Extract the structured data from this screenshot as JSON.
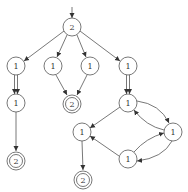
{
  "diagram": {
    "type": "state-graph",
    "start_node": "n0",
    "nodes": [
      {
        "id": "n0",
        "label": "2",
        "x": 72,
        "y": 27,
        "accepting": false
      },
      {
        "id": "n1",
        "label": "1",
        "x": 16,
        "y": 66,
        "accepting": false
      },
      {
        "id": "n2",
        "label": "1",
        "x": 53,
        "y": 66,
        "accepting": false
      },
      {
        "id": "n3",
        "label": "1",
        "x": 90,
        "y": 66,
        "accepting": false
      },
      {
        "id": "n4",
        "label": "1",
        "x": 128,
        "y": 66,
        "accepting": false
      },
      {
        "id": "n5",
        "label": "1",
        "x": 16,
        "y": 103,
        "accepting": false
      },
      {
        "id": "n6",
        "label": "2",
        "x": 72,
        "y": 104,
        "accepting": true
      },
      {
        "id": "n7",
        "label": "1",
        "x": 128,
        "y": 103,
        "accepting": false
      },
      {
        "id": "n8",
        "label": "2",
        "x": 16,
        "y": 161,
        "accepting": true
      },
      {
        "id": "n9",
        "label": "1",
        "x": 82,
        "y": 132,
        "accepting": false
      },
      {
        "id": "n10",
        "label": "1",
        "x": 173,
        "y": 132,
        "accepting": false
      },
      {
        "id": "n11",
        "label": "1",
        "x": 128,
        "y": 159,
        "accepting": false
      },
      {
        "id": "n12",
        "label": "2",
        "x": 83,
        "y": 180,
        "accepting": true
      }
    ],
    "edges": [
      {
        "from": "n0",
        "to": "n1",
        "style": "single"
      },
      {
        "from": "n0",
        "to": "n2",
        "style": "single"
      },
      {
        "from": "n0",
        "to": "n3",
        "style": "single"
      },
      {
        "from": "n0",
        "to": "n4",
        "style": "single"
      },
      {
        "from": "n1",
        "to": "n5",
        "style": "double"
      },
      {
        "from": "n2",
        "to": "n6",
        "style": "single"
      },
      {
        "from": "n3",
        "to": "n6",
        "style": "single"
      },
      {
        "from": "n4",
        "to": "n7",
        "style": "double"
      },
      {
        "from": "n5",
        "to": "n8",
        "style": "single"
      },
      {
        "from": "n7",
        "to": "n9",
        "style": "single"
      },
      {
        "from": "n7",
        "to": "n10",
        "style": "curved"
      },
      {
        "from": "n10",
        "to": "n7",
        "style": "curved"
      },
      {
        "from": "n11",
        "to": "n10",
        "style": "curved"
      },
      {
        "from": "n10",
        "to": "n11",
        "style": "curved"
      },
      {
        "from": "n11",
        "to": "n9",
        "style": "single"
      },
      {
        "from": "n9",
        "to": "n12",
        "style": "single"
      }
    ]
  }
}
